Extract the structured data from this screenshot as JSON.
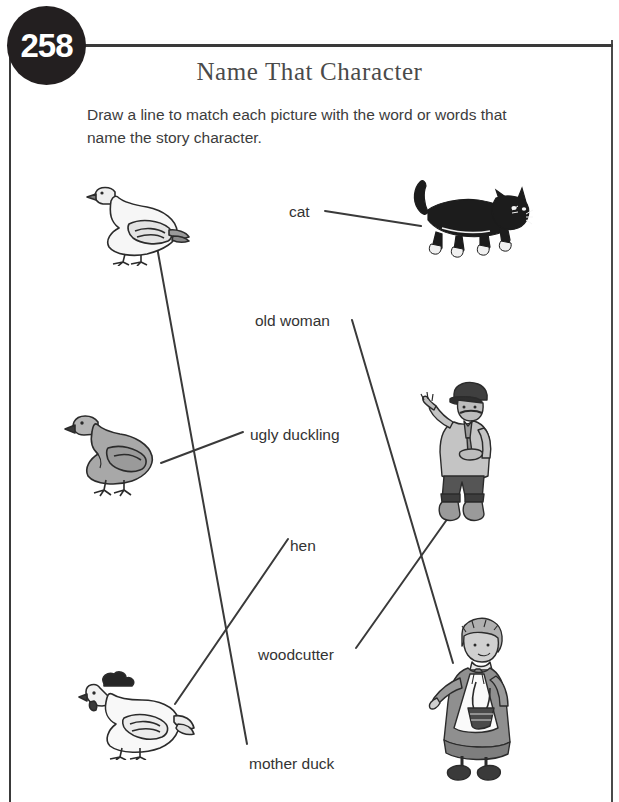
{
  "page": {
    "number": "258",
    "title": "Name That Character",
    "instructions": "Draw a line to match each picture with the word or words that name the story character."
  },
  "words": [
    {
      "id": "cat",
      "label": "cat",
      "x": 289,
      "y": 203
    },
    {
      "id": "old-woman",
      "label": "old woman",
      "x": 255,
      "y": 312
    },
    {
      "id": "ugly-duckling",
      "label": "ugly duckling",
      "x": 250,
      "y": 426
    },
    {
      "id": "hen",
      "label": "hen",
      "x": 290,
      "y": 537
    },
    {
      "id": "woodcutter",
      "label": "woodcutter",
      "x": 258,
      "y": 646
    },
    {
      "id": "mother-duck",
      "label": "mother duck",
      "x": 249,
      "y": 755
    }
  ],
  "pictures": [
    {
      "id": "goose",
      "name": "white-goose",
      "x": 85,
      "y": 176,
      "width": 105,
      "height": 90
    },
    {
      "id": "cat-art",
      "name": "black-cat",
      "x": 408,
      "y": 176,
      "width": 125,
      "height": 80
    },
    {
      "id": "duckling",
      "name": "grey-duckling",
      "x": 62,
      "y": 404,
      "width": 105,
      "height": 95
    },
    {
      "id": "woodcutter-art",
      "name": "woodcutter-man",
      "x": 420,
      "y": 376,
      "width": 90,
      "height": 145
    },
    {
      "id": "hen-art",
      "name": "white-hen",
      "x": 78,
      "y": 668,
      "width": 115,
      "height": 90
    },
    {
      "id": "old-woman-art",
      "name": "old-woman-with-basket",
      "x": 428,
      "y": 612,
      "width": 95,
      "height": 175
    }
  ],
  "connections": [
    {
      "id": "line-cat",
      "from": "cat",
      "to": "cat-art",
      "x1": 325,
      "y1": 211,
      "x2": 421,
      "y2": 226
    },
    {
      "id": "line-mother-duck",
      "from": "mother-duck",
      "to": "goose",
      "x1": 247,
      "y1": 744,
      "x2": 157,
      "y2": 247
    },
    {
      "id": "line-old-woman",
      "from": "old-woman",
      "to": "old-woman-art",
      "x1": 352,
      "y1": 320,
      "x2": 453,
      "y2": 663
    },
    {
      "id": "line-ugly-duckling",
      "from": "ugly-duckling",
      "to": "duckling",
      "x1": 243,
      "y1": 432,
      "x2": 161,
      "y2": 463
    },
    {
      "id": "line-hen",
      "from": "hen",
      "to": "hen-art",
      "x1": 288,
      "y1": 539,
      "x2": 175,
      "y2": 704
    },
    {
      "id": "line-woodcutter",
      "from": "woodcutter",
      "to": "woodcutter-art",
      "x1": 356,
      "y1": 648,
      "x2": 448,
      "y2": 518
    }
  ],
  "colors": {
    "ink": "#231f20",
    "line": "#3a3a3a",
    "title": "#4a4a4a",
    "text": "#333333",
    "grey_fill": "#9e9e9e",
    "light_fill": "#f2f2f2",
    "dark_fill": "#4d4d4d"
  }
}
